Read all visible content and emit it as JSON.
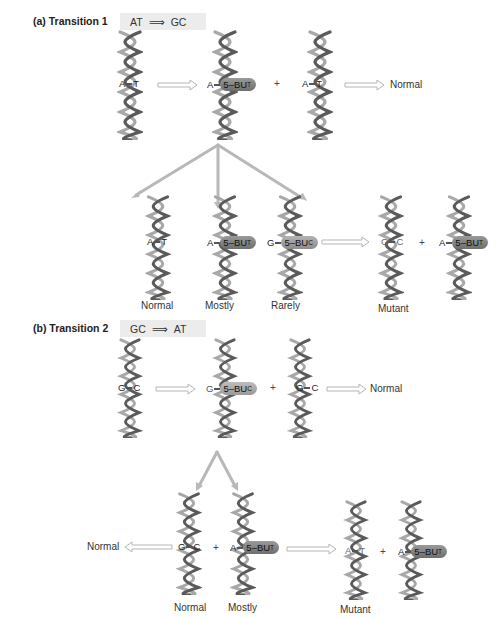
{
  "panel_a": {
    "title": "(a) Transition 1",
    "from": "AT",
    "to": "GC",
    "row1": {
      "helix1_pair": {
        "left": "A",
        "right": "T"
      },
      "helix2_pair": {
        "left": "A",
        "analog": "5–BU",
        "sub": "T"
      },
      "plus": "+",
      "helix3_pair": {
        "left": "A",
        "right": "T"
      },
      "outcome": "Normal"
    },
    "row2": {
      "helix1_pair": {
        "left": "A",
        "right": "T"
      },
      "helix2_pair": {
        "left": "A",
        "analog": "5–BU",
        "sub": "T"
      },
      "helix3_pair": {
        "left": "G",
        "analog": "5–BU",
        "sub": "C"
      },
      "helix4_pair": {
        "left": "G",
        "right": "C"
      },
      "plus": "+",
      "helix5_pair": {
        "left": "A",
        "analog": "5–BU",
        "sub": "T"
      },
      "labels": [
        "Normal",
        "Mostly",
        "Rarely",
        "Mutant"
      ]
    }
  },
  "panel_b": {
    "title": "(b) Transition 2",
    "from": "GC",
    "to": "AT",
    "row1": {
      "helix1_pair": {
        "left": "G",
        "right": "C"
      },
      "helix2_pair": {
        "left": "G",
        "analog": "5–BU",
        "sub": "C"
      },
      "plus": "+",
      "helix3_pair": {
        "left": "G",
        "right": "C"
      },
      "outcome": "Normal"
    },
    "row2": {
      "outcome_left": "Normal",
      "helix1_pair": {
        "left": "G",
        "right": "C"
      },
      "plus1": "+",
      "helix2_pair": {
        "left": "A",
        "analog": "5–BU",
        "sub": "T"
      },
      "helix3_pair": {
        "left": "A",
        "right": "T"
      },
      "plus2": "+",
      "helix4_pair": {
        "left": "A",
        "analog": "5–BU",
        "sub": "T"
      },
      "labels": [
        "Normal",
        "Mostly",
        "Mutant"
      ]
    }
  },
  "colors": {
    "helix_dark": "#555555",
    "helix_light": "#a8a8a8",
    "arrow": "#bdbdbd",
    "bu_capsule": "#8a8a8a",
    "header_bg": "#ececec"
  }
}
